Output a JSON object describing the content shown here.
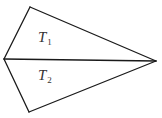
{
  "figure": {
    "type": "two triangles sharing a common edge (kite shape)",
    "vertices": {
      "top": [
        30,
        7
      ],
      "left": [
        4,
        59
      ],
      "right": [
        156,
        61
      ],
      "bottom": [
        29,
        112
      ]
    },
    "edges": [
      [
        "left",
        "top"
      ],
      [
        "top",
        "right"
      ],
      [
        "left",
        "right"
      ],
      [
        "left",
        "bottom"
      ],
      [
        "bottom",
        "right"
      ]
    ],
    "line_color": "#1a1a1a",
    "background": "#ffffff"
  },
  "labels": {
    "t1": {
      "main": "T",
      "sub": "1"
    },
    "t2": {
      "main": "T",
      "sub": "2"
    }
  }
}
